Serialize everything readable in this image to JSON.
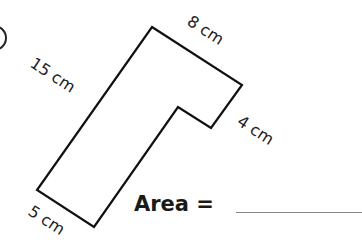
{
  "figure": {
    "shape": "L-shaped polygon (rotated)",
    "stroke_color": "#111111",
    "vertices": [
      [
        152,
        27
      ],
      [
        242,
        85
      ],
      [
        211,
        128
      ],
      [
        178,
        107
      ],
      [
        94,
        227
      ],
      [
        37,
        190
      ]
    ],
    "side_labels": {
      "top": "8 cm",
      "left": "15 cm",
      "right": "4 cm",
      "bottom": "5 cm"
    }
  },
  "question": {
    "label": "Area ="
  }
}
